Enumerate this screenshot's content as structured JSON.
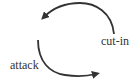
{
  "diagram": {
    "type": "cycle",
    "labels": {
      "attack": "attack",
      "cut_in": "cut-in"
    },
    "arrows": [
      {
        "from": "cut-in",
        "direction": "counter-clockwise",
        "position": "upper"
      },
      {
        "from": "attack",
        "direction": "counter-clockwise",
        "position": "lower"
      }
    ],
    "colors": {
      "stroke": "#333333",
      "text": "#333333",
      "background": "#ffffff"
    }
  }
}
